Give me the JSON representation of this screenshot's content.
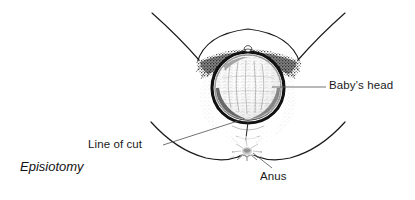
{
  "figure": {
    "caption": "Episiotomy",
    "background_color": "#ffffff",
    "ink_color": "#1a1a1a",
    "leader_line_color": "#555555"
  },
  "labels": {
    "babys_head": {
      "text": "Baby’s head",
      "target": "vaginal-opening-crowning-head"
    },
    "line_of_cut": {
      "text": "Line of cut",
      "target": "midline-perineal-incision"
    },
    "anus": {
      "text": "Anus",
      "target": "anus"
    }
  },
  "anatomy": {
    "parts": [
      "left-thigh",
      "right-thigh",
      "mons-pubis-arc",
      "pubic-hair-stipple",
      "labia-majora",
      "vaginal-introitus",
      "baby-head-crowning",
      "perineum",
      "incision-line",
      "anus",
      "left-buttock",
      "right-buttock"
    ]
  }
}
